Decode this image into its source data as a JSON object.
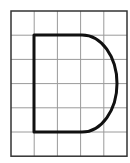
{
  "diagram": {
    "type": "grid-shape",
    "grid": {
      "columns": 5,
      "rows": 6,
      "origin_x": 11,
      "origin_y": 11,
      "cell_width": 23.2,
      "cell_height": 24.2,
      "line_color": "#9a9a9a",
      "border_color": "#333333"
    },
    "shape": {
      "name": "D-shape",
      "description": "Rectangle with left straight edge and a semi-elliptical right side",
      "stroke_color": "#111111",
      "stroke_width": 3,
      "left_x": 34,
      "top_y": 35,
      "bottom_y": 132,
      "straight_end_x": 82,
      "curve_max_x": 117
    }
  }
}
